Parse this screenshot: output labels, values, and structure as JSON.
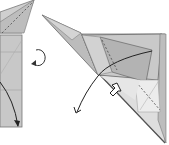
{
  "diagram": {
    "type": "origami-folding-instructions",
    "steps": [
      {
        "name": "previous-step",
        "description": "Partial folded model with dashed valley-fold line and curved fold arrow downward"
      },
      {
        "name": "current-step",
        "description": "Folded model with curved fold arrow, push (sink) arrow, and dashed fold lines"
      }
    ],
    "symbols": [
      "turn-over-arrow",
      "fold-arrow",
      "push-arrow",
      "valley-fold-line"
    ],
    "colors": {
      "paper_light": "#d8d8d8",
      "paper_mid": "#c2c2c2",
      "paper_dark": "#a8a8a8",
      "outline": "#6a6a6a",
      "arrow": "#222222",
      "background": "#ffffff"
    }
  }
}
